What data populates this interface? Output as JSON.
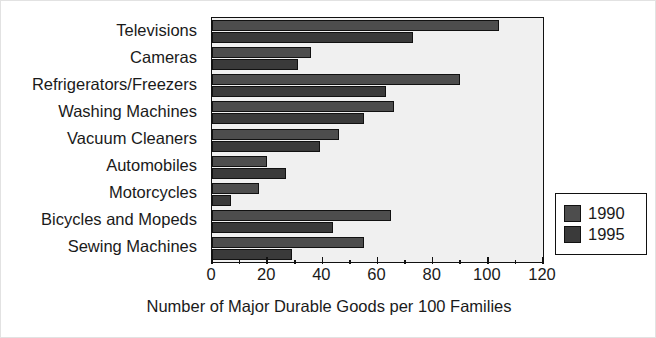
{
  "chart_data": {
    "type": "bar",
    "orientation": "horizontal",
    "title": "",
    "xlabel": "Number of Major Durable Goods per 100 Families",
    "ylabel": "",
    "xlim": [
      0,
      120
    ],
    "xticks": [
      0,
      20,
      40,
      60,
      80,
      100,
      120
    ],
    "xtick_labels": [
      "0",
      "20",
      "40",
      "60",
      "80",
      "100",
      "120"
    ],
    "minor_tick_step": 10,
    "grid": false,
    "legend_position": "right-outside",
    "categories": [
      "Televisions",
      "Cameras",
      "Refrigerators/Freezers",
      "Washing Machines",
      "Vacuum Cleaners",
      "Automobiles",
      "Motorcycles",
      "Bicycles and Mopeds",
      "Sewing Machines"
    ],
    "series": [
      {
        "name": "1990",
        "color": "#4d4d4d",
        "values": [
          104,
          36,
          90,
          66,
          46,
          20,
          17,
          65,
          55
        ]
      },
      {
        "name": "1995",
        "color": "#3a3a3a",
        "values": [
          73,
          31,
          63,
          55,
          39,
          27,
          7,
          44,
          29
        ]
      }
    ]
  },
  "legend": {
    "entries": [
      {
        "label": "1990",
        "color": "#4d4d4d"
      },
      {
        "label": "1995",
        "color": "#3a3a3a"
      }
    ]
  },
  "colors": {
    "plot_background": "#f0f0f0",
    "axis": "#111111",
    "text": "#1a1a1a",
    "page_background": "#ffffff"
  }
}
